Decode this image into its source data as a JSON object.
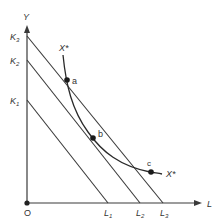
{
  "diagram": {
    "type": "isocost-isoquant",
    "colors": {
      "line": "#3a3a3a",
      "text": "#333333",
      "background": "#ffffff"
    },
    "axes": {
      "y_label": "Y",
      "x_label": "L",
      "origin_label": "O"
    },
    "y_intercepts": [
      {
        "label": "K",
        "sub": "3"
      },
      {
        "label": "K",
        "sub": "2"
      },
      {
        "label": "K",
        "sub": "1"
      }
    ],
    "x_intercepts": [
      {
        "label": "L",
        "sub": "1"
      },
      {
        "label": "L",
        "sub": "2"
      },
      {
        "label": "L",
        "sub": "3"
      }
    ],
    "curve": {
      "label_top": "X*",
      "label_bottom": "X*"
    },
    "points": [
      {
        "label": "a"
      },
      {
        "label": "b"
      },
      {
        "label": "c"
      }
    ]
  }
}
